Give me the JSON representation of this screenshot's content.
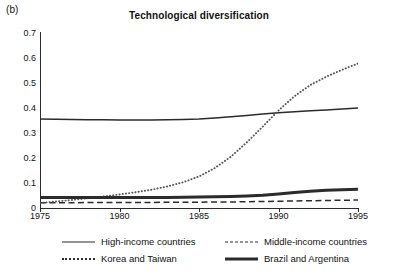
{
  "panel": {
    "label": "(b)"
  },
  "chart_data": {
    "type": "line",
    "title": "Technological diversification",
    "xlabel": "",
    "ylabel": "",
    "xlim": [
      1975,
      1995
    ],
    "ylim": [
      0,
      0.7
    ],
    "grid": false,
    "legend_position": "bottom",
    "x_ticks": [
      "1975",
      "1980",
      "1985",
      "1990",
      "1995"
    ],
    "y_ticks": [
      "0",
      "0.1",
      "0.2",
      "0.3",
      "0.4",
      "0.5",
      "0.6",
      "0.7"
    ],
    "x": [
      1975,
      1976,
      1977,
      1978,
      1979,
      1980,
      1981,
      1982,
      1983,
      1984,
      1985,
      1986,
      1987,
      1988,
      1989,
      1990,
      1991,
      1992,
      1993,
      1994,
      1995
    ],
    "series": [
      {
        "name": "High-income countries",
        "style": "solid",
        "color": "#2b2b2b",
        "values": [
          0.356,
          0.355,
          0.354,
          0.353,
          0.353,
          0.352,
          0.352,
          0.352,
          0.353,
          0.354,
          0.356,
          0.36,
          0.365,
          0.37,
          0.376,
          0.381,
          0.385,
          0.389,
          0.392,
          0.396,
          0.4
        ]
      },
      {
        "name": "Middle-income countries",
        "style": "dashed",
        "color": "#2b2b2b",
        "values": [
          0.021,
          0.021,
          0.021,
          0.022,
          0.022,
          0.022,
          0.022,
          0.022,
          0.023,
          0.023,
          0.023,
          0.024,
          0.024,
          0.025,
          0.026,
          0.027,
          0.028,
          0.029,
          0.03,
          0.031,
          0.032
        ]
      },
      {
        "name": "Korea and Taiwan",
        "style": "dotted",
        "color": "#555555",
        "values": [
          0.02,
          0.026,
          0.032,
          0.039,
          0.046,
          0.054,
          0.063,
          0.073,
          0.086,
          0.103,
          0.126,
          0.16,
          0.205,
          0.262,
          0.325,
          0.39,
          0.447,
          0.492,
          0.525,
          0.553,
          0.578
        ]
      },
      {
        "name": "Brazil and Argentina",
        "style": "thick",
        "color": "#2b2b2b",
        "values": [
          0.042,
          0.042,
          0.042,
          0.042,
          0.042,
          0.042,
          0.042,
          0.042,
          0.042,
          0.043,
          0.044,
          0.045,
          0.046,
          0.048,
          0.051,
          0.056,
          0.062,
          0.067,
          0.071,
          0.073,
          0.075
        ]
      }
    ]
  }
}
